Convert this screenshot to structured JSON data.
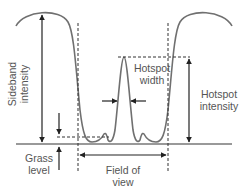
{
  "diagram": {
    "labels": {
      "sideband_line1": "Sideband",
      "sideband_line2": "intensity",
      "hotspot_width_line1": "Hotspot",
      "hotspot_width_line2": "width",
      "hotspot_intensity_line1": "Hotspot",
      "hotspot_intensity_line2": "intensity",
      "grass_line1": "Grass",
      "grass_line2": "level",
      "fov_line1": "Field of",
      "fov_line2": "view"
    },
    "colors": {
      "curve": "#707070",
      "arrows": "#222222",
      "dashed": "#333333",
      "baseline": "#777777",
      "text": "#555555"
    }
  }
}
